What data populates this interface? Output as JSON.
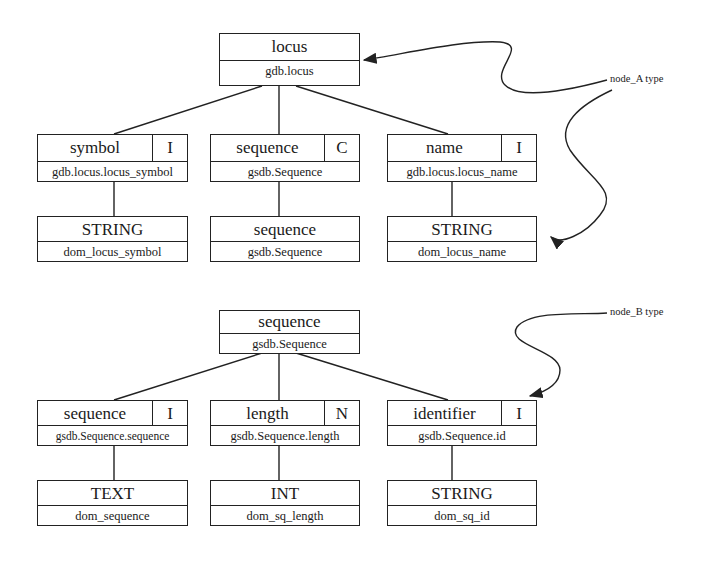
{
  "diagram": {
    "tree_a": {
      "root": {
        "name": "locus",
        "table": "gdb.locus"
      },
      "children": [
        {
          "name": "symbol",
          "flag": "I",
          "column": "gdb.locus.locus_symbol",
          "type": {
            "name": "STRING",
            "domain": "dom_locus_symbol"
          }
        },
        {
          "name": "sequence",
          "flag": "C",
          "column": "gsdb.Sequence",
          "type": {
            "name": "sequence",
            "domain": "gsdb.Sequence"
          }
        },
        {
          "name": "name",
          "flag": "I",
          "column": "gdb.locus.locus_name",
          "type": {
            "name": "STRING",
            "domain": "dom_locus_name"
          }
        }
      ],
      "annotation": "node_A type"
    },
    "tree_b": {
      "root": {
        "name": "sequence",
        "table": "gsdb.Sequence"
      },
      "children": [
        {
          "name": "sequence",
          "flag": "I",
          "column": "gsdb.Sequence.sequence",
          "type": {
            "name": "TEXT",
            "domain": "dom_sequence"
          }
        },
        {
          "name": "length",
          "flag": "N",
          "column": "gsdb.Sequence.length",
          "type": {
            "name": "INT",
            "domain": "dom_sq_length"
          }
        },
        {
          "name": "identifier",
          "flag": "I",
          "column": "gsdb.Sequence.id",
          "type": {
            "name": "STRING",
            "domain": "dom_sq_id"
          }
        }
      ],
      "annotation": "node_B type"
    }
  }
}
